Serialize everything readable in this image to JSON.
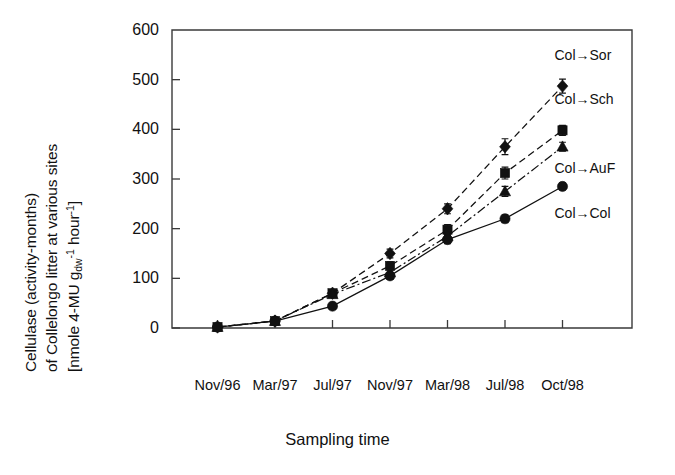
{
  "chart_data": {
    "type": "line",
    "title": "",
    "xlabel": "Sampling time",
    "ylabel": "Cellulase (activity-months) of Collelongo litter at various sites [nmole 4-MU g_dw^-1 hour^-1]",
    "ylabel_lines": [
      "Cellulase (activity-months)",
      "of Collelongo litter at various sites",
      "[nmole 4-MU g"
    ],
    "ylabel_units_sub": "dw",
    "ylabel_units_sup1": "-1",
    "ylabel_units_tail": " hour",
    "ylabel_units_sup2": "-1",
    "ylabel_units_close": "]",
    "categories": [
      "Nov/96",
      "Mar/97",
      "Jul/97",
      "Nov/97",
      "Mar/98",
      "Jul/98",
      "Oct/98"
    ],
    "ylim": [
      0,
      600
    ],
    "yticks": [
      0,
      100,
      200,
      300,
      400,
      500,
      600
    ],
    "ytick_labels": [
      "0",
      "100",
      "200",
      "300",
      "400",
      "500",
      "600"
    ],
    "grid": false,
    "legend_position": "inline-right-of-last-point",
    "series": [
      {
        "name": "Col→Sor",
        "marker": "diamond",
        "linestyle": "dashed",
        "values": [
          2,
          14,
          70,
          150,
          240,
          365,
          487
        ],
        "errors": [
          2,
          4,
          6,
          9,
          10,
          16,
          14
        ]
      },
      {
        "name": "Col→Sch",
        "marker": "square",
        "linestyle": "dashed",
        "values": [
          2,
          14,
          70,
          125,
          198,
          312,
          398
        ],
        "errors": [
          2,
          4,
          7,
          8,
          10,
          12,
          10
        ]
      },
      {
        "name": "Col→AuF",
        "marker": "triangle",
        "linestyle": "dash-dot",
        "values": [
          2,
          14,
          68,
          112,
          185,
          275,
          365
        ],
        "errors": [
          2,
          4,
          6,
          8,
          9,
          10,
          9
        ]
      },
      {
        "name": "Col→Col",
        "marker": "circle",
        "linestyle": "solid",
        "values": [
          2,
          14,
          44,
          105,
          178,
          220,
          285
        ],
        "errors": [
          2,
          4,
          5,
          7,
          8,
          8,
          7
        ]
      }
    ],
    "colors": {
      "series": "#111111",
      "axis": "#3a3a3a",
      "background": "#ffffff"
    }
  }
}
